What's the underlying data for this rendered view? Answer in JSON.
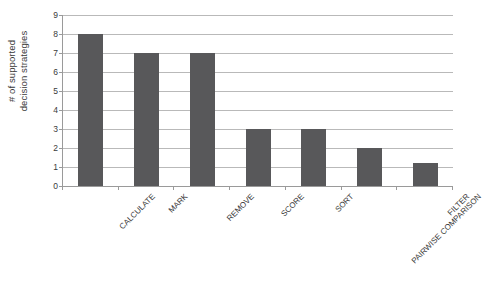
{
  "chart_data": {
    "type": "bar",
    "title": "",
    "xlabel": "",
    "ylabel": "# of supported decision strategies",
    "ylabel_lines": [
      "# of supported",
      "decision strategies"
    ],
    "categories": [
      "CALCULATE",
      "MARK",
      "REMOVE",
      "SCORE",
      "SORT",
      "PAIRWISE COMPARISON",
      "FILTER"
    ],
    "values": [
      8,
      7,
      7,
      3,
      3,
      2,
      1.2
    ],
    "ylim": [
      0,
      9
    ],
    "ytick_labels": [
      "0",
      "1",
      "2",
      "3",
      "4",
      "5",
      "6",
      "7",
      "8",
      "9"
    ],
    "ytick_values": [
      0,
      1,
      2,
      3,
      4,
      5,
      6,
      7,
      8,
      9
    ],
    "grid": true,
    "legend": "none",
    "bar_color": "#58585a",
    "gridline_color": "#b9b9b9",
    "axis_color": "#9a9a9a",
    "background_color": "#ffffff"
  }
}
